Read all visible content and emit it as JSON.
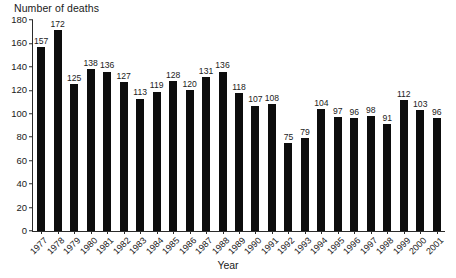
{
  "chart_data": {
    "type": "bar",
    "title": "",
    "ylabel": "Number of deaths",
    "xlabel": "Year",
    "ylim": [
      0,
      180
    ],
    "yticks": [
      0,
      20,
      40,
      60,
      80,
      100,
      120,
      140,
      160,
      180
    ],
    "grid": false,
    "legend": null,
    "bar_color": "#0d0d0d",
    "show_value_labels": true,
    "categories": [
      "1977",
      "1978",
      "1979",
      "1980",
      "1981",
      "1982",
      "1983",
      "1984",
      "1985",
      "1986",
      "1987",
      "1988",
      "1989",
      "1990",
      "1991",
      "1992",
      "1993",
      "1994",
      "1995",
      "1996",
      "1997",
      "1998",
      "1999",
      "2000",
      "2001"
    ],
    "values": [
      157,
      172,
      125,
      138,
      136,
      127,
      113,
      119,
      128,
      120,
      131,
      136,
      118,
      107,
      108,
      75,
      79,
      104,
      97,
      96,
      98,
      91,
      112,
      103,
      96
    ]
  }
}
